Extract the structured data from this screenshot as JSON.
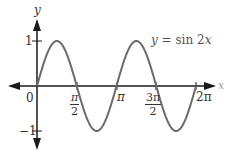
{
  "chart_data": {
    "type": "line",
    "title": "",
    "function": "y = sin 2x",
    "series": [
      {
        "name": "y = sin 2x",
        "x": [
          "0",
          "π/4",
          "π/2",
          "3π/4",
          "π",
          "5π/4",
          "3π/2",
          "7π/4",
          "2π"
        ],
        "values": [
          0,
          1,
          0,
          -1,
          0,
          1,
          0,
          -1,
          0
        ],
        "color": "#6b6b6b"
      }
    ],
    "xlabel": "x",
    "ylabel": "y",
    "x_ticks": [
      "0",
      "π/2",
      "π",
      "3π/2",
      "2π"
    ],
    "y_ticks": [
      "1",
      "-1"
    ],
    "xlim": [
      "< 0",
      "> 2π"
    ],
    "ylim": [
      "< -1",
      "> 1"
    ],
    "grid": false,
    "legend": "inline annotation near upper right"
  },
  "labels": {
    "y_axis": "y",
    "x_axis": "x",
    "origin": "0",
    "y_one": "1",
    "y_neg_one": "−1",
    "pi_half_num": "π",
    "pi_half_den": "2",
    "pi": "π",
    "three_pi_half_num": "3π",
    "three_pi_half_den": "2",
    "two_pi": "2π",
    "equation_y": "y",
    "equation_rest": " = sin 2",
    "equation_x": "x"
  },
  "colors": {
    "axis": "#1a1a1a",
    "curve": "#6b6b6b",
    "text": "#333333"
  }
}
